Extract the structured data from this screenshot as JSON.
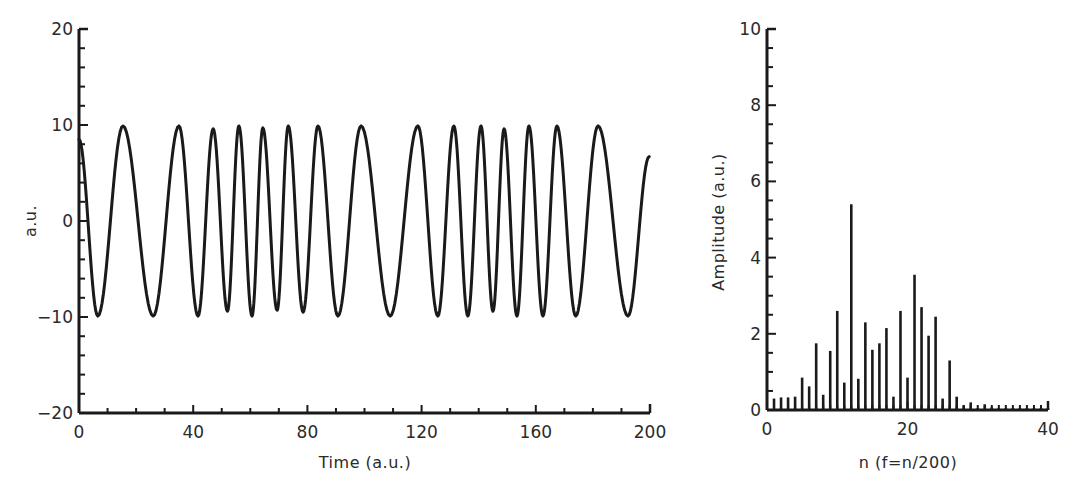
{
  "chart_data": [
    {
      "id": "time_series",
      "type": "line",
      "title": "",
      "xlabel": "Time (a.u.)",
      "ylabel": "a.u.",
      "xlim": [
        0,
        200
      ],
      "ylim": [
        -20,
        20
      ],
      "xticks": [
        0,
        40,
        80,
        120,
        160,
        200
      ],
      "xtick_labels": [
        "0",
        "40",
        "80",
        "120",
        "160",
        "200"
      ],
      "yticks": [
        -20,
        -10,
        0,
        10,
        20
      ],
      "ytick_labels": [
        "-20",
        "-10",
        "0",
        "10",
        "20"
      ],
      "x_minor_step": 10,
      "y_minor_step": 2,
      "grid": false,
      "legend": null,
      "series": [
        {
          "name": "signal",
          "description": "Oscillation of amplitude ~10 with varying frequency (extrema points)",
          "x": [
            0,
            6.6,
            15.4,
            26,
            35,
            41.7,
            47,
            52,
            56,
            60.6,
            64.4,
            69.4,
            73.3,
            78.5,
            83.7,
            90.7,
            98.8,
            109,
            118.7,
            125.7,
            131.3,
            136.2,
            140.8,
            145,
            148.9,
            153.4,
            157.6,
            162.5,
            167.4,
            174,
            181.8,
            192.3,
            199.7
          ],
          "y": [
            8.5,
            -9.9,
            9.9,
            -9.9,
            9.9,
            -9.9,
            9.6,
            -9.4,
            9.9,
            -9.9,
            9.7,
            -9.3,
            9.9,
            -9.5,
            9.9,
            -9.9,
            9.9,
            -9.9,
            9.9,
            -9.9,
            9.9,
            -9.9,
            9.9,
            -9.4,
            9.6,
            -9.9,
            9.9,
            -9.9,
            9.9,
            -9.9,
            9.9,
            -9.9,
            6.7
          ]
        }
      ]
    },
    {
      "id": "spectrum",
      "type": "bar",
      "title": "",
      "xlabel": "n (f=n/200)",
      "ylabel": "Amplitude (a.u.)",
      "xlim": [
        0,
        40
      ],
      "ylim": [
        0,
        10
      ],
      "xticks": [
        0,
        20,
        40
      ],
      "xtick_labels": [
        "0",
        "20",
        "40"
      ],
      "yticks": [
        0,
        2,
        4,
        6,
        8,
        10
      ],
      "ytick_labels": [
        "0",
        "2",
        "4",
        "6",
        "8",
        "10"
      ],
      "x_minor_step": 1,
      "y_minor_step": 0.5,
      "grid": false,
      "legend": null,
      "categories": [
        1,
        2,
        3,
        4,
        5,
        6,
        7,
        8,
        9,
        10,
        11,
        12,
        13,
        14,
        15,
        16,
        17,
        18,
        19,
        20,
        21,
        22,
        23,
        24,
        25,
        26,
        27,
        28,
        29,
        30,
        31,
        32,
        33,
        34,
        35,
        36,
        37,
        38,
        39,
        40
      ],
      "values": [
        0.3,
        0.33,
        0.33,
        0.35,
        0.85,
        0.62,
        1.75,
        0.4,
        1.55,
        2.6,
        0.72,
        5.4,
        0.82,
        2.3,
        1.58,
        1.75,
        2.15,
        0.35,
        2.6,
        0.85,
        3.55,
        2.7,
        1.95,
        2.45,
        0.3,
        1.3,
        0.35,
        0.12,
        0.2,
        0.05,
        0.15,
        0.07,
        0.05,
        0.05,
        0.05,
        0.05,
        0.05,
        0.05,
        0.05,
        0.05
      ]
    }
  ],
  "left_chart": {
    "ylabel": "a.u.",
    "xlabel": "Time  (a.u.)"
  },
  "right_chart": {
    "ylabel": "Amplitude  (a.u.)",
    "xlabel": "n (f=n/200)"
  },
  "colors": {
    "ink": "#1a1a1a",
    "background": "#ffffff"
  }
}
